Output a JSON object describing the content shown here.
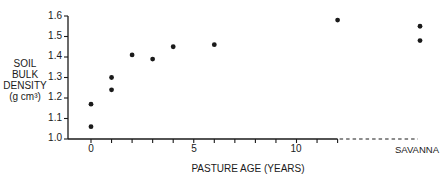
{
  "chart_data": {
    "type": "scatter",
    "title": "",
    "xlabel": "PASTURE AGE (YEARS)",
    "ylabel_lines": [
      "SOIL",
      "BULK",
      "DENSITY",
      "(g cm³)"
    ],
    "ylabel": "SOIL BULK DENSITY (g cm³)",
    "xlim": [
      0,
      12
    ],
    "ylim": [
      1.0,
      1.6
    ],
    "x_ticks": [
      0,
      1,
      2,
      3,
      4,
      5,
      6,
      7,
      8,
      9,
      10,
      11,
      12
    ],
    "x_tick_labels": [
      {
        "value": 0,
        "label": "0"
      },
      {
        "value": 5,
        "label": "5"
      },
      {
        "value": 10,
        "label": "10"
      }
    ],
    "y_tick_labels": [
      "1.0",
      "1.1",
      "1.2",
      "1.3",
      "1.4",
      "1.5",
      "1.6"
    ],
    "y_ticks": [
      1.0,
      1.1,
      1.2,
      1.3,
      1.4,
      1.5,
      1.6
    ],
    "extra_category": "SAVANNA",
    "grid": false,
    "legend": null,
    "series": [
      {
        "name": "pasture",
        "points": [
          {
            "x": 0,
            "y": 1.17
          },
          {
            "x": 0,
            "y": 1.06
          },
          {
            "x": 1,
            "y": 1.3
          },
          {
            "x": 1,
            "y": 1.24
          },
          {
            "x": 2,
            "y": 1.41
          },
          {
            "x": 3,
            "y": 1.39
          },
          {
            "x": 4,
            "y": 1.45
          },
          {
            "x": 6,
            "y": 1.46
          },
          {
            "x": 12,
            "y": 1.58
          }
        ]
      },
      {
        "name": "SAVANNA",
        "points": [
          {
            "x": "SAVANNA",
            "y": 1.55
          },
          {
            "x": "SAVANNA",
            "y": 1.48
          }
        ]
      }
    ]
  },
  "labels": {
    "ylabel_1": "SOIL",
    "ylabel_2": "BULK",
    "ylabel_3": "DENSITY",
    "ylabel_4": "(g cm³)",
    "xtitle": "PASTURE AGE (YEARS)",
    "savanna": "SAVANNA",
    "y": [
      "1.0",
      "1.1",
      "1.2",
      "1.3",
      "1.4",
      "1.5",
      "1.6"
    ],
    "x": [
      "0",
      "5",
      "10"
    ]
  },
  "colors": {
    "ink": "#1a1a1a",
    "background": "#ffffff"
  }
}
